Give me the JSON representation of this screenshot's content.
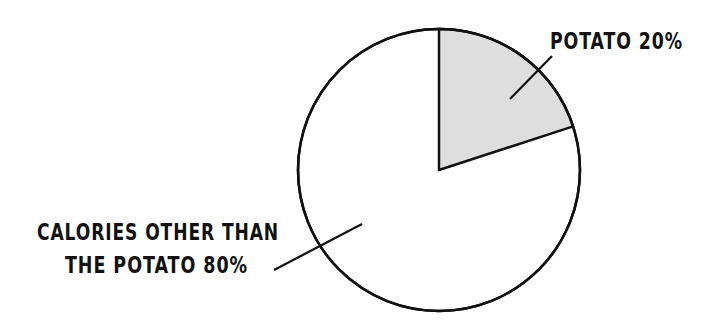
{
  "chart_data": {
    "type": "pie",
    "title": "",
    "slices": [
      {
        "label": "POTATO",
        "value": 20,
        "display": "POTATO 20%",
        "color": "#dedede"
      },
      {
        "label": "CALORIES OTHER THAN THE POTATO",
        "value": 80,
        "display_lines": [
          "CALORIES OTHER THAN",
          "THE POTATO 80%"
        ],
        "color": "#ffffff"
      }
    ],
    "start_angle_deg": 0,
    "direction": "clockwise",
    "legend": "none",
    "labels": "external with leader lines"
  },
  "labels": {
    "potato": "POTATO 20%",
    "other_line1": "CALORIES OTHER THAN",
    "other_line2": "THE POTATO 80%"
  },
  "colors": {
    "stroke": "#111111",
    "potato_fill": "#dedede",
    "other_fill": "#ffffff"
  }
}
